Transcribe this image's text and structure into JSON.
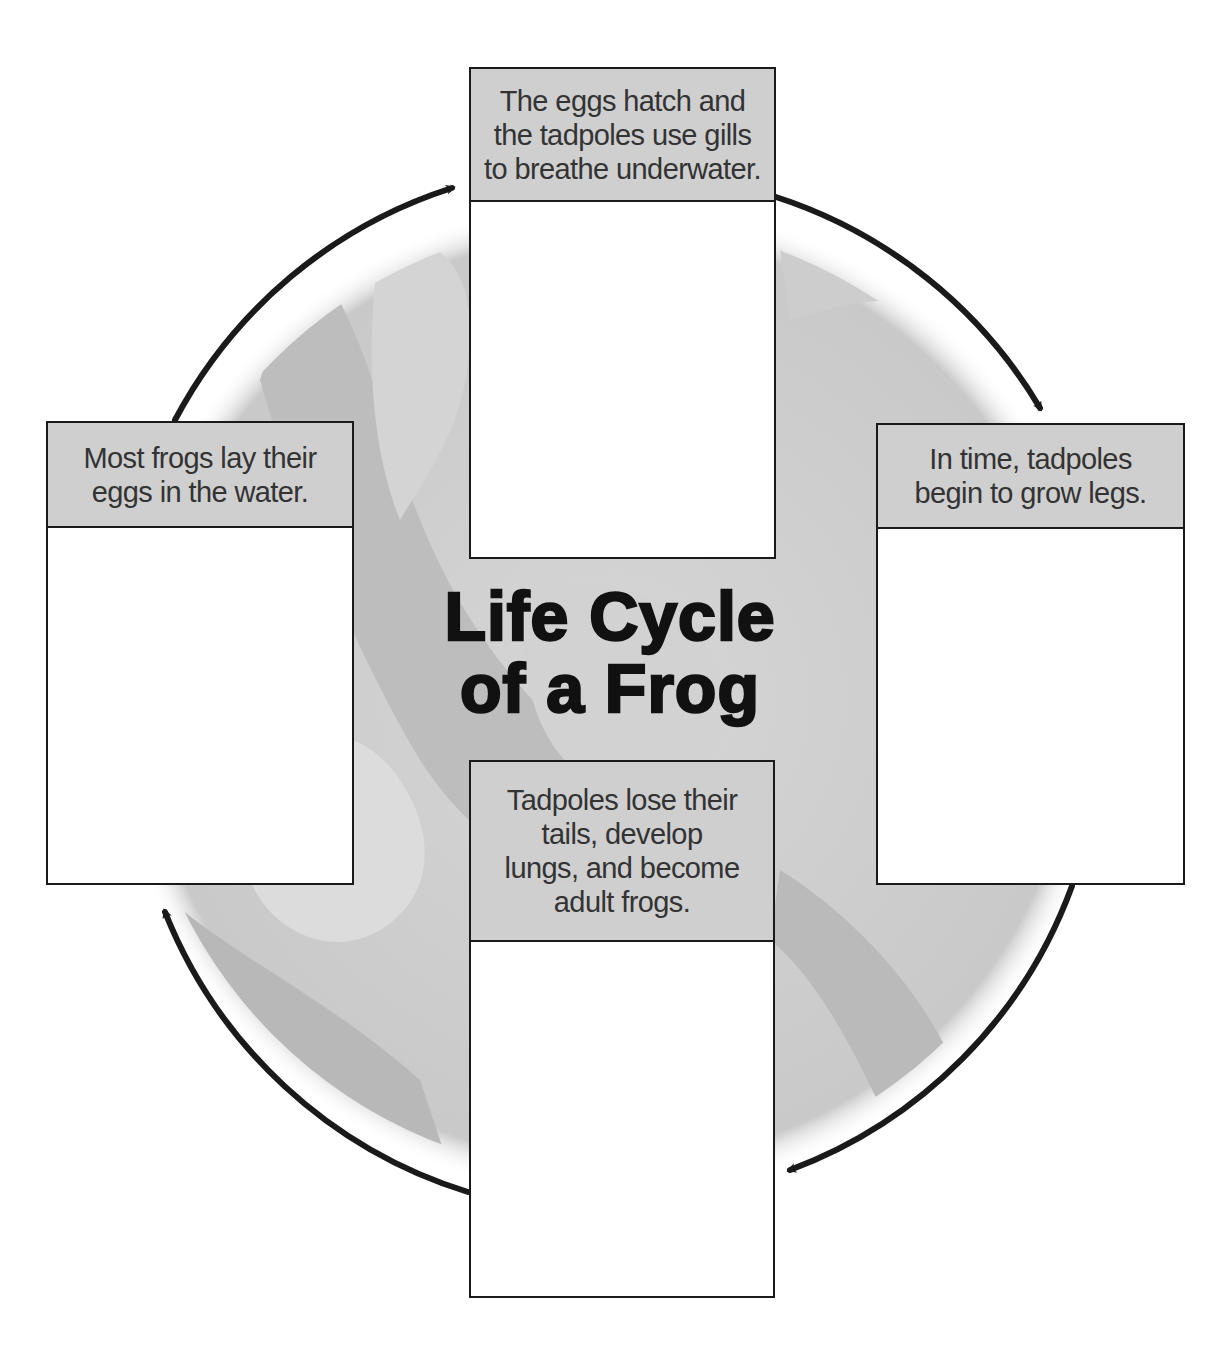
{
  "diagram": {
    "title_lines": [
      "Life Cycle",
      "of a Frog"
    ],
    "type": "cycle",
    "direction": "clockwise",
    "colors": {
      "header_fill": "#cfcfcf",
      "circle_fill": "#c8c8c8",
      "arrow": "#1a1a1a",
      "box_border": "#1a1a1a",
      "text": "#333333"
    },
    "stages": [
      {
        "position": "left",
        "order": 1,
        "lines": [
          "Most frogs lay their",
          "eggs in the water."
        ]
      },
      {
        "position": "top",
        "order": 2,
        "lines": [
          "The eggs hatch and",
          "the tadpoles use gills",
          "to breathe underwater."
        ]
      },
      {
        "position": "right",
        "order": 3,
        "lines": [
          "In time, tadpoles",
          "begin to grow legs."
        ]
      },
      {
        "position": "bottom",
        "order": 4,
        "lines": [
          "Tadpoles lose their",
          "tails, develop",
          "lungs, and become",
          "adult frogs."
        ]
      }
    ],
    "arrows": [
      {
        "from": "left",
        "to": "top"
      },
      {
        "from": "top",
        "to": "right"
      },
      {
        "from": "right",
        "to": "bottom"
      },
      {
        "from": "bottom",
        "to": "left"
      }
    ]
  }
}
